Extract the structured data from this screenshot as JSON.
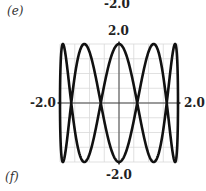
{
  "labels": {
    "top_prev_label": "-2.0",
    "part_e": "(e)",
    "part_f": "(f)"
  },
  "chart_data": {
    "type": "line",
    "title": "",
    "parametric": {
      "x": "2*sin(t)",
      "y": "2*cos(5*t)",
      "t_range": [
        0,
        6.2832
      ]
    },
    "xlim": [
      -2.0,
      2.0
    ],
    "ylim": [
      -2.0,
      2.0
    ],
    "tick_labels": {
      "x_min": "-2.0",
      "x_max": "2.0",
      "y_max": "2.0",
      "y_min": "-2.0"
    },
    "grid": true,
    "grid_step": 0.5,
    "xlabel": "",
    "ylabel": ""
  },
  "colors": {
    "curve": "#111111",
    "grid": "#d9d9d9",
    "axis": "#444444"
  }
}
